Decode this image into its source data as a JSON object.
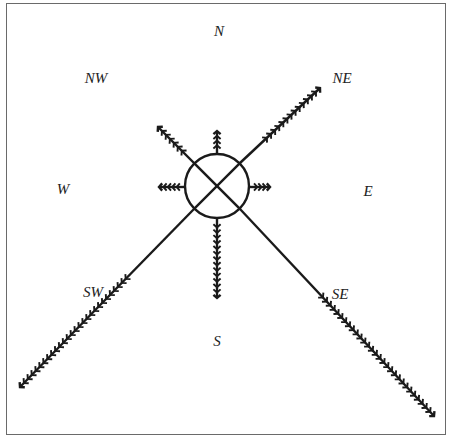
{
  "diagram": {
    "type": "compass-wind-rose",
    "center": {
      "x": 217,
      "y": 186,
      "radius": 32
    },
    "stroke_color": "#1a1a1a",
    "frame_color": "#6a6a6a",
    "labels": {
      "N": {
        "text": "N",
        "x": 219,
        "y": 31
      },
      "NE": {
        "text": "NE",
        "x": 342,
        "y": 78
      },
      "E": {
        "text": "E",
        "x": 368,
        "y": 191
      },
      "SE": {
        "text": "SE",
        "x": 340,
        "y": 294
      },
      "S": {
        "text": "S",
        "x": 217,
        "y": 341
      },
      "SW": {
        "text": "SW",
        "x": 93,
        "y": 292
      },
      "W": {
        "text": "W",
        "x": 63,
        "y": 189
      },
      "NW": {
        "text": "NW",
        "x": 96,
        "y": 78
      }
    },
    "arrows": [
      {
        "direction": "N",
        "from": [
          217,
          154
        ],
        "to": [
          217,
          131
        ],
        "feathers": 4
      },
      {
        "direction": "NE",
        "from": [
          240,
          163
        ],
        "to": [
          320,
          88
        ],
        "feathers": 14
      },
      {
        "direction": "E",
        "from": [
          249,
          187
        ],
        "to": [
          270,
          187
        ],
        "feathers": 4
      },
      {
        "direction": "SE",
        "from": [
          240,
          209
        ],
        "to": [
          434,
          416
        ],
        "feathers": 30
      },
      {
        "direction": "S",
        "from": [
          217,
          218
        ],
        "to": [
          217,
          298
        ],
        "feathers": 14
      },
      {
        "direction": "SW",
        "from": [
          194,
          209
        ],
        "to": [
          20,
          387
        ],
        "feathers": 28
      },
      {
        "direction": "W",
        "from": [
          185,
          187
        ],
        "to": [
          159,
          187
        ],
        "feathers": 5
      },
      {
        "direction": "NW",
        "from": [
          194,
          163
        ],
        "to": [
          158,
          127
        ],
        "feathers": 7
      }
    ]
  }
}
